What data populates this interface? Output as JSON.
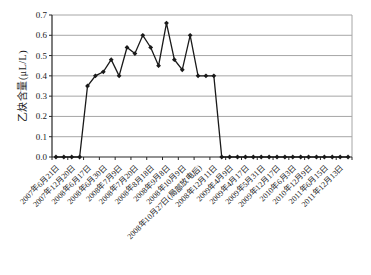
{
  "chart_data": {
    "type": "line",
    "title": "",
    "xlabel": "",
    "ylabel": "乙炔含量(μL/L)",
    "ylim": [
      0,
      0.7
    ],
    "ytick_step": 0.1,
    "grid": true,
    "legend": "none",
    "label_interval": 2,
    "x_labels": [
      "2007年6月21日",
      "2007年12月20日",
      "2008年6月17日",
      "2008年6月30日",
      "2008年7月9日",
      "2008年7月20日",
      "2008年8月18日",
      "2008年9月8日",
      "2008年10月9日",
      "2008年10月27日(局部放电后)",
      "2008年12月11日",
      "2009年4月9日",
      "2009年4月17日",
      "2009年5月31日",
      "2009年12月17日",
      "2010年6月3日",
      "2010年12月9日",
      "2011年6月15日",
      "2011年12月13日"
    ],
    "series": [
      {
        "name": "乙炔含量",
        "values": [
          0,
          0,
          0,
          0,
          0.35,
          0.4,
          0.42,
          0.48,
          0.4,
          0.54,
          0.51,
          0.6,
          0.54,
          0.45,
          0.66,
          0.48,
          0.43,
          0.6,
          0.4,
          0.4,
          0.4,
          0,
          0,
          0,
          0,
          0,
          0,
          0,
          0,
          0,
          0,
          0,
          0,
          0,
          0,
          0,
          0,
          0
        ]
      }
    ],
    "colors": {
      "line": "#1a1a1a",
      "marker": "#1a1a1a",
      "grid": "#a6a6a6",
      "axis": "#262626",
      "background": "#ffffff"
    },
    "marker": "diamond"
  }
}
